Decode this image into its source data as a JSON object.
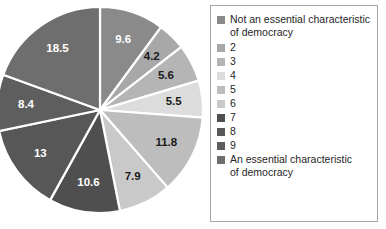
{
  "chart_data": {
    "type": "pie",
    "title": "",
    "subtitle": "",
    "xlabel": "",
    "ylabel": "",
    "grid": false,
    "legend_position": "right",
    "start_angle_deg": 0,
    "direction": "clockwise",
    "categories": [
      "Not an essential characteristic of democracy",
      "2",
      "3",
      "4",
      "5",
      "6",
      "7",
      "8",
      "9",
      "An essential characteristic of democracy"
    ],
    "values": [
      9.6,
      4.2,
      5.6,
      5.5,
      11.8,
      7.9,
      10.6,
      13,
      8.4,
      18.5
    ],
    "data_labels": [
      "9.6",
      "4.2",
      "5.6",
      "5.5",
      "11.8",
      "7.9",
      "10.6",
      "13",
      "8.4",
      "18.5"
    ],
    "slice_colors": [
      "#8a8a8a",
      "#a8a8a8",
      "#b5b5b5",
      "#dcdcdc",
      "#bdbdbd",
      "#c9c9c9",
      "#4f4f4f",
      "#575757",
      "#5e5e5e",
      "#6e6e6e"
    ],
    "label_text_colors": [
      "#ffffff",
      "#1a1a1a",
      "#1a1a1a",
      "#1a1a1a",
      "#1a1a1a",
      "#1a1a1a",
      "#ffffff",
      "#ffffff",
      "#ffffff",
      "#ffffff"
    ],
    "separator_color": "#ffffff"
  },
  "legend": {
    "items": [
      {
        "label": "Not an essential characteristic\nof democracy",
        "color": "#8a8a8a"
      },
      {
        "label": "2",
        "color": "#a8a8a8"
      },
      {
        "label": "3",
        "color": "#b5b5b5"
      },
      {
        "label": "4",
        "color": "#dcdcdc"
      },
      {
        "label": "5",
        "color": "#bdbdbd"
      },
      {
        "label": "6",
        "color": "#c9c9c9"
      },
      {
        "label": "7",
        "color": "#4f4f4f"
      },
      {
        "label": "8",
        "color": "#575757"
      },
      {
        "label": "9",
        "color": "#5e5e5e"
      },
      {
        "label": "An essential characteristic\nof democracy",
        "color": "#6e6e6e"
      }
    ]
  },
  "geometry": {
    "center_x": 100,
    "center_y": 110,
    "radius": 103,
    "label_radius_factor": 0.72
  }
}
